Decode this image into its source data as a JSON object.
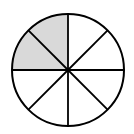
{
  "diagram": {
    "type": "fraction-circle",
    "total_slices": 8,
    "shaded_slices": 2,
    "shaded_indices": [
      6,
      7
    ],
    "fraction_shaded": "2/8",
    "colors": {
      "shade": "#d9d9d9",
      "stroke": "#000000",
      "background": "#ffffff"
    },
    "geometry": {
      "cx": 68,
      "cy": 70,
      "r": 56
    }
  }
}
